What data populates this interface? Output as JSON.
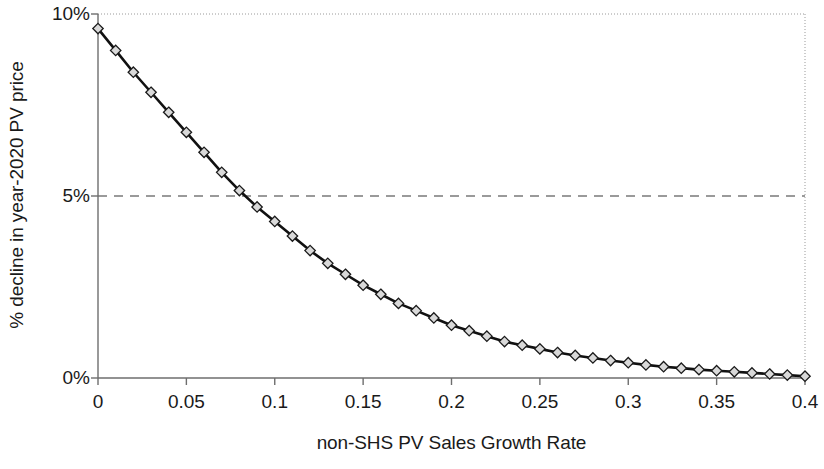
{
  "chart_data": {
    "type": "line",
    "title": "",
    "subtitle": "",
    "xlabel": "non-SHS PV Sales Growth Rate",
    "ylabel": "% decline in year-2020 PV price",
    "xlim": [
      0,
      0.4
    ],
    "ylim": [
      0,
      10
    ],
    "xticks": [
      0,
      0.05,
      0.1,
      0.15,
      0.2,
      0.25,
      0.3,
      0.35,
      0.4
    ],
    "xtick_labels": [
      "0",
      "0.05",
      "0.1",
      "0.15",
      "0.2",
      "0.25",
      "0.3",
      "0.35",
      "0.4"
    ],
    "yticks": [
      0,
      5,
      10
    ],
    "ytick_labels": [
      "0%",
      "5%",
      "10%"
    ],
    "grid": "top-dotted-border, right-dotted-border, 5%-dashed-horizontal",
    "legend": "none",
    "marker": "diamond",
    "marker_fill": "#d9d9d9",
    "marker_stroke": "#1a1a1a",
    "line_color": "#111111",
    "gridline_dashed_value": 5,
    "x": [
      0,
      0.01,
      0.02,
      0.03,
      0.04,
      0.05,
      0.06,
      0.07,
      0.08,
      0.09,
      0.1,
      0.11,
      0.12,
      0.13,
      0.14,
      0.15,
      0.16,
      0.17,
      0.18,
      0.19,
      0.2,
      0.21,
      0.22,
      0.23,
      0.24,
      0.25,
      0.26,
      0.27,
      0.28,
      0.29,
      0.3,
      0.31,
      0.32,
      0.33,
      0.34,
      0.35,
      0.36,
      0.37,
      0.38,
      0.39,
      0.4
    ],
    "series": [
      {
        "name": "% decline in year-2020 PV price",
        "values": [
          9.6,
          9.0,
          8.4,
          7.85,
          7.3,
          6.75,
          6.2,
          5.65,
          5.15,
          4.7,
          4.3,
          3.9,
          3.5,
          3.15,
          2.85,
          2.55,
          2.3,
          2.05,
          1.85,
          1.65,
          1.45,
          1.3,
          1.15,
          1.0,
          0.9,
          0.8,
          0.7,
          0.62,
          0.55,
          0.48,
          0.42,
          0.36,
          0.31,
          0.27,
          0.23,
          0.2,
          0.17,
          0.14,
          0.11,
          0.08,
          0.05
        ]
      }
    ]
  },
  "colors": {
    "axis": "#6e6e6e",
    "dashed_gridline": "#7a7a7a",
    "dotted_border": "#9a9a9a",
    "line": "#111111",
    "marker_fill": "#d9d9d9",
    "text": "#1a1a1a"
  }
}
